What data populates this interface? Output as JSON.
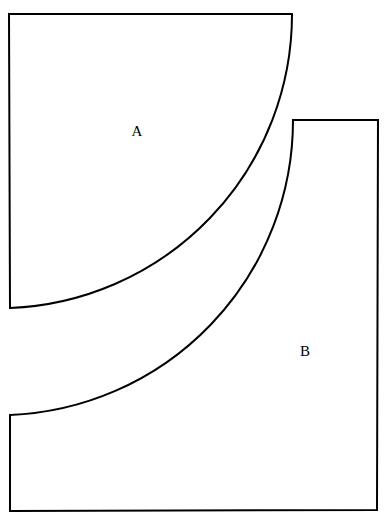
{
  "figure": {
    "type": "geometric-diagram",
    "canvas": {
      "width": 387,
      "height": 526,
      "background": "#ffffff"
    },
    "style": {
      "stroke_color": "#000000",
      "stroke_width": 2,
      "fill_color": "#ffffff"
    },
    "regions": [
      {
        "id": "A",
        "label": "A",
        "label_x": 137,
        "label_y": 131,
        "description": "Upper-left region: square corner with a quarter-circle arc cut on its lower-right side",
        "vertices": [
          {
            "x": 9,
            "y": 14
          },
          {
            "x": 292,
            "y": 14
          },
          {
            "x": 10,
            "y": 308
          }
        ],
        "arc": {
          "from": {
            "x": 292,
            "y": 14
          },
          "to": {
            "x": 10,
            "y": 308
          },
          "radius": 294,
          "center": {
            "x": 10,
            "y": 14
          },
          "sweep": "clockwise"
        },
        "path": "M 9 14 L 292 14 A 294 294 0 0 1 10 308 Z"
      },
      {
        "id": "B",
        "label": "B",
        "label_x": 305,
        "label_y": 351,
        "description": "Lower-right L-shaped region bounded above-left by the outer circular arc",
        "vertices": [
          {
            "x": 293,
            "y": 120
          },
          {
            "x": 378,
            "y": 120
          },
          {
            "x": 377,
            "y": 510
          },
          {
            "x": 10,
            "y": 511
          },
          {
            "x": 10,
            "y": 415
          }
        ],
        "arc": {
          "from": {
            "x": 293,
            "y": 120
          },
          "to": {
            "x": 10,
            "y": 415
          },
          "radius": 295,
          "center": {
            "x": 10,
            "y": 120
          },
          "sweep": "counterclockwise"
        },
        "path": "M 293 120 L 378 120 L 377 510 L 10 511 L 10 415 A 295 295 0 0 0 293 120 Z"
      }
    ]
  }
}
